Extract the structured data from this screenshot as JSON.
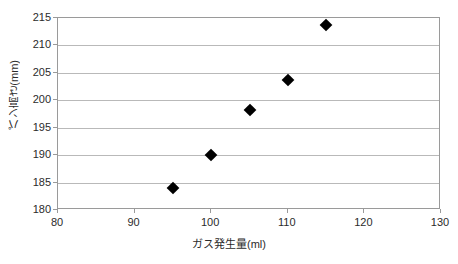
{
  "chart_data": {
    "type": "scatter",
    "title": "",
    "xlabel": "ガス発生量(ml)",
    "ylabel": "パン高さ(mm)",
    "xlim": [
      80,
      130
    ],
    "ylim": [
      180,
      215
    ],
    "xticks": [
      80,
      90,
      100,
      110,
      120,
      130
    ],
    "yticks": [
      180,
      185,
      190,
      195,
      200,
      205,
      210,
      215
    ],
    "xtick_labels": [
      "80",
      "90",
      "100",
      "110",
      "120",
      "130"
    ],
    "ytick_labels": [
      "180",
      "185",
      "190",
      "195",
      "200",
      "205",
      "210",
      "215"
    ],
    "grid": "horizontal",
    "legend": null,
    "marker": "diamond",
    "marker_color": "#000000",
    "series": [
      {
        "name": "",
        "points": [
          {
            "x": 95,
            "y": 184.0
          },
          {
            "x": 100,
            "y": 190.1
          },
          {
            "x": 105,
            "y": 198.2
          },
          {
            "x": 110,
            "y": 203.7
          },
          {
            "x": 115,
            "y": 213.7
          }
        ]
      }
    ]
  },
  "style": {
    "grid_color": "#b9b9b9",
    "axis_color": "#9a9a9a",
    "text_color": "#2b2b2b",
    "background": "#ffffff"
  }
}
